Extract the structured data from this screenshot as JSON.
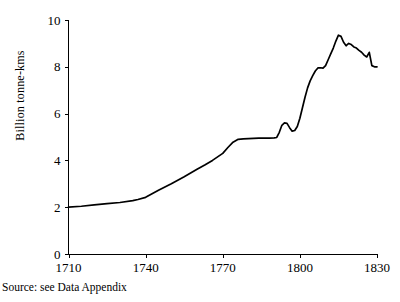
{
  "chart_data": {
    "type": "line",
    "title": "",
    "subtitle": "",
    "xlabel": "",
    "ylabel": "Billion tonne-kms",
    "xlim": [
      1710,
      1830
    ],
    "ylim": [
      0,
      10
    ],
    "grid": false,
    "legend": null,
    "x_ticks": [
      1710,
      1740,
      1770,
      1800,
      1830
    ],
    "x_tick_labels": [
      "1710",
      "1740",
      "1770",
      "1800",
      "1830"
    ],
    "y_ticks": [
      0,
      2,
      4,
      6,
      8,
      10
    ],
    "y_tick_labels": [
      "0",
      "2",
      "4",
      "6",
      "8",
      "10"
    ],
    "line_color": "#000000",
    "series": [
      {
        "name": "Billion tonne-kms",
        "x": [
          1710,
          1715,
          1720,
          1725,
          1730,
          1735,
          1737,
          1740,
          1745,
          1750,
          1755,
          1760,
          1763,
          1766,
          1770,
          1772,
          1774,
          1776,
          1778,
          1780,
          1782,
          1784,
          1786,
          1788,
          1790,
          1791,
          1792,
          1793,
          1794,
          1795,
          1796,
          1797,
          1798,
          1799,
          1800,
          1801,
          1802,
          1803,
          1804,
          1805,
          1806,
          1807,
          1808,
          1809,
          1810,
          1811,
          1812,
          1813,
          1814,
          1815,
          1816,
          1817,
          1818,
          1819,
          1820,
          1821,
          1822,
          1823,
          1824,
          1825,
          1826,
          1827,
          1828,
          1829,
          1830
        ],
        "y": [
          2.0,
          2.04,
          2.1,
          2.15,
          2.2,
          2.28,
          2.33,
          2.42,
          2.72,
          3.0,
          3.3,
          3.62,
          3.8,
          4.0,
          4.3,
          4.55,
          4.78,
          4.9,
          4.92,
          4.93,
          4.94,
          4.95,
          4.95,
          4.95,
          4.96,
          4.98,
          5.2,
          5.5,
          5.6,
          5.58,
          5.4,
          5.25,
          5.28,
          5.45,
          5.8,
          6.25,
          6.7,
          7.1,
          7.4,
          7.62,
          7.82,
          7.95,
          7.96,
          7.94,
          8.05,
          8.3,
          8.55,
          8.8,
          9.1,
          9.35,
          9.3,
          9.05,
          8.9,
          9.0,
          8.95,
          8.85,
          8.8,
          8.7,
          8.62,
          8.5,
          8.42,
          8.62,
          8.05,
          8.0,
          8.0
        ]
      }
    ]
  },
  "axis": {
    "y_title": "Billion tonne-kms"
  },
  "footer": {
    "source_note": "Source: see Data Appendix"
  }
}
